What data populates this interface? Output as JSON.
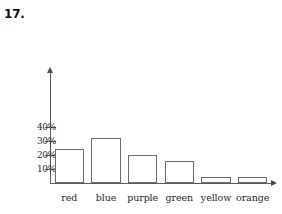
{
  "problem": {
    "number": "17."
  },
  "chart_data": {
    "type": "bar",
    "title": "",
    "xlabel": "",
    "ylabel": "",
    "categories": [
      "red",
      "blue",
      "purple",
      "green",
      "yellow",
      "orange"
    ],
    "values": [
      24,
      32,
      20,
      16,
      4,
      4
    ],
    "value_labels": [
      "24%",
      "32%",
      "20%",
      "16%",
      "4%",
      "4%"
    ],
    "ylim": [
      0,
      45
    ],
    "y_ticks": [
      10,
      20,
      30,
      40
    ],
    "y_tick_labels": [
      "10%",
      "20%",
      "30%",
      "40%"
    ],
    "grid": false,
    "legend": false,
    "legend_position": "none",
    "bar_fill_color": "#ffffff",
    "bar_border_color": "#6b6b6b",
    "axis_color": "#5a5a5a",
    "background_color": "#ffffff"
  }
}
